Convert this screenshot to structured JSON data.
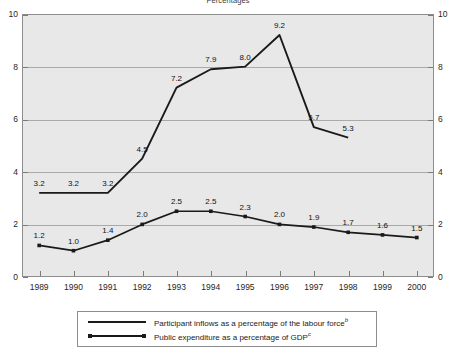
{
  "chart_data": {
    "type": "line",
    "title": "Percentages",
    "xlabel": "",
    "ylabel": "",
    "ylim": [
      0,
      10
    ],
    "yticks": [
      0,
      2,
      4,
      6,
      8,
      10
    ],
    "ytick_labels_left": [
      "0",
      "2",
      "4",
      "6",
      "8",
      "10"
    ],
    "ytick_labels_right": [
      "0",
      "2",
      "4",
      "6",
      "8",
      "10"
    ],
    "grid": true,
    "legend_position": "bottom",
    "categories": [
      "1989",
      "1990",
      "1991",
      "1992",
      "1993",
      "1994",
      "1995",
      "1996",
      "1997",
      "1998",
      "1999",
      "2000"
    ],
    "series": [
      {
        "name": "Participant inflows as a percentage of the labour force",
        "footnote": "b",
        "marker": "none",
        "values": [
          3.2,
          3.2,
          3.2,
          4.5,
          7.2,
          7.9,
          8.0,
          9.2,
          5.7,
          5.3,
          null,
          null
        ],
        "labels": [
          "3.2",
          "3.2",
          "3.2",
          "4.5",
          "7.2",
          "7.9",
          "8.0",
          "9.2",
          "5.7",
          "5.3",
          "",
          ""
        ]
      },
      {
        "name": "Public expenditure as a percentage of GDP",
        "footnote": "c",
        "marker": "square",
        "values": [
          1.2,
          1.0,
          1.4,
          2.0,
          2.5,
          2.5,
          2.3,
          2.0,
          1.9,
          1.7,
          1.6,
          1.5
        ],
        "labels": [
          "1.2",
          "1.0",
          "1.4",
          "2.0",
          "2.5",
          "2.5",
          "2.3",
          "2.0",
          "1.9",
          "1.7",
          "1.6",
          "1.5"
        ]
      }
    ],
    "colors": {
      "line": "#1a1a1a",
      "plot_background": "#e8e8e8",
      "gridline": "#a9a9a9",
      "frame": "#8d8d8d"
    }
  },
  "legend": {
    "items": [
      {
        "label": "Participant inflows as a percentage of the labour force",
        "footnote": "b"
      },
      {
        "label": "Public expenditure as a percentage of GDP",
        "footnote": "c"
      }
    ]
  }
}
